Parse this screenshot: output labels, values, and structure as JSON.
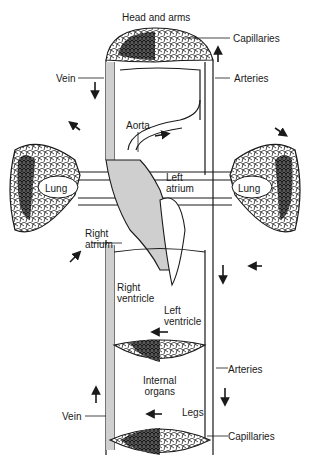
{
  "diagram": {
    "type": "circulatory-system-schematic",
    "labels": {
      "head_and_arms": "Head and arms",
      "capillaries_top": "Capillaries",
      "vein_top": "Vein",
      "arteries_top": "Arteries",
      "aorta": "Aorta",
      "left_atrium_1": "Left",
      "left_atrium_2": "atrium",
      "lung_left": "Lung",
      "lung_right": "Lung",
      "right_atrium_1": "Right",
      "right_atrium_2": "atrium",
      "right_ventricle_1": "Right",
      "right_ventricle_2": "ventricle",
      "left_ventricle_1": "Left",
      "left_ventricle_2": "ventricle",
      "arteries_bottom": "Arteries",
      "internal_organs_1": "Internal",
      "internal_organs_2": "organs",
      "legs": "Legs",
      "vein_bottom": "Vein",
      "capillaries_bottom": "Capillaries"
    },
    "colors": {
      "ink": "#1a1a1a",
      "deoxygenated_fill": "#cfcfcf",
      "background": "#ffffff"
    }
  }
}
